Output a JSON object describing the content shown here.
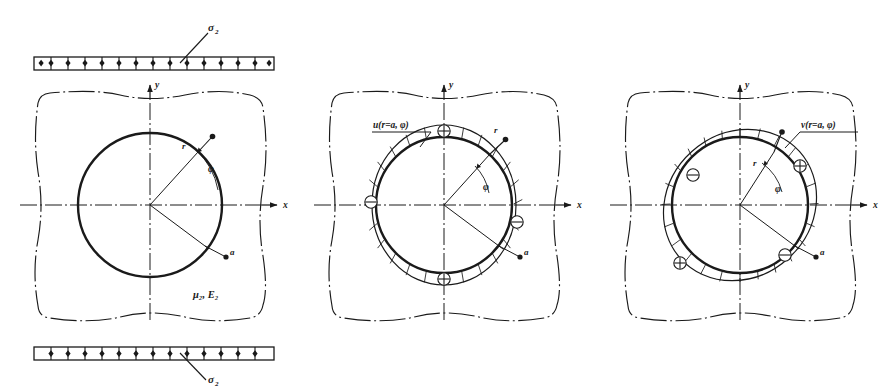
{
  "figure": {
    "caption_present": false,
    "background_color": "#ffffff",
    "ink_color": "#1a1a1a",
    "panel_count": 3
  },
  "load": {
    "top_label": "σ",
    "top_label_sub": "2",
    "bottom_label": "σ",
    "bottom_label_sub": "2",
    "tick_count": 14
  },
  "panels": [
    {
      "id": "panel-geometry",
      "axis_x_label": "x",
      "axis_y_label": "y",
      "radius_label": "r",
      "angle_label": "φ",
      "hole_radius_label": "a",
      "material_label": "μ",
      "material_label_sub": "2",
      "material_label_2": "E",
      "material_label_2_sub": "2",
      "material_full": "μ₂, E₂",
      "has_hatching": false
    },
    {
      "id": "panel-radial-displacement",
      "axis_x_label": "x",
      "axis_y_label": "y",
      "radius_label": "r",
      "angle_label": "φ",
      "hole_radius_label": "a",
      "field_label": "u(r=a, φ)",
      "has_hatching": true,
      "sign_markers": [
        {
          "sign": "⊕",
          "position": "top"
        },
        {
          "sign": "⊖",
          "position": "left"
        },
        {
          "sign": "⊖",
          "position": "right"
        },
        {
          "sign": "⊕",
          "position": "bottom"
        }
      ]
    },
    {
      "id": "panel-tangential-displacement",
      "axis_x_label": "x",
      "axis_y_label": "y",
      "radius_label": "r",
      "angle_label": "φ",
      "hole_radius_label": "a",
      "field_label": "v(r=a, φ)",
      "has_hatching": true,
      "sign_markers": [
        {
          "sign": "⊕",
          "position": "upper-right"
        },
        {
          "sign": "⊖",
          "position": "upper-left"
        },
        {
          "sign": "⊕",
          "position": "lower-left"
        },
        {
          "sign": "⊖",
          "position": "lower-right"
        }
      ]
    }
  ]
}
